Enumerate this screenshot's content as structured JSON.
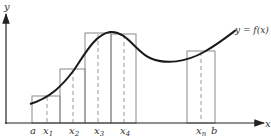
{
  "figure": {
    "type": "riemann-sum-diagram",
    "axis_labels": {
      "x": "x",
      "y": "y"
    },
    "curve_label": "y = f(x)",
    "curve_label_parts": {
      "lhs": "y",
      "eq": " = ",
      "rhs": "f(x)"
    },
    "tick_labels": [
      {
        "base": "a",
        "sub": ""
      },
      {
        "base": "x",
        "sub": "1"
      },
      {
        "base": "x",
        "sub": "2"
      },
      {
        "base": "x",
        "sub": "3"
      },
      {
        "base": "x",
        "sub": "4"
      },
      {
        "base": "x",
        "sub": "n"
      },
      {
        "base": "b",
        "sub": ""
      }
    ],
    "rectangles_count_visible": 5,
    "colors": {
      "axis": "#222222",
      "curve": "#1a1a1a",
      "rect": "#888888",
      "dash": "#999999"
    }
  }
}
